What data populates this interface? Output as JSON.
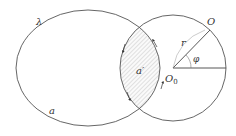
{
  "diagram": {
    "labels": {
      "lambda": "λ",
      "region_a": "a",
      "region_a_prime": "a′",
      "point_O": "O",
      "center_O0": "O",
      "center_O0_sub": "0",
      "radius_r": "r",
      "angle_phi": "φ"
    },
    "colors": {
      "stroke": "#555555",
      "hatch": "#9a9a9a",
      "text": "#333333",
      "background": "#ffffff"
    },
    "shapes": {
      "ellipse": {
        "cx": 88,
        "cy": 68,
        "rx": 72,
        "ry": 58
      },
      "circle": {
        "cx": 173,
        "cy": 68,
        "r": 53
      },
      "intersections": [
        [
          139,
          29
        ],
        [
          141,
          108
        ]
      ]
    }
  }
}
